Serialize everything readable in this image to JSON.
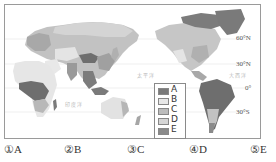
{
  "map": {
    "latitude_labels": [
      "60°N",
      "30°N",
      "0°",
      "30°S"
    ],
    "ocean_labels": [
      "太平洋",
      "大西洋",
      "印度洋"
    ],
    "colors": {
      "A": "#7a7a7a",
      "B": "#e6e6e6",
      "C": "#b9b9b9",
      "D": "#d2d2d2",
      "E": "#8c8c8c",
      "ocean": "#ffffff",
      "gridline": "#d8d8d8"
    }
  },
  "legend": {
    "items": [
      {
        "label": "A",
        "color": "#7a7a7a"
      },
      {
        "label": "B",
        "color": "#e8e8e8"
      },
      {
        "label": "C",
        "color": "#bcbcbc"
      },
      {
        "label": "D",
        "color": "#d6d6d6"
      },
      {
        "label": "E",
        "color": "#8a8a8a"
      }
    ]
  },
  "options": [
    {
      "marker": "①",
      "label": "A",
      "text": "①A"
    },
    {
      "marker": "②",
      "label": "B",
      "text": "②B"
    },
    {
      "marker": "③",
      "label": "C",
      "text": "③C"
    },
    {
      "marker": "④",
      "label": "D",
      "text": "④D"
    },
    {
      "marker": "⑤",
      "label": "E",
      "text": "⑤E"
    }
  ]
}
